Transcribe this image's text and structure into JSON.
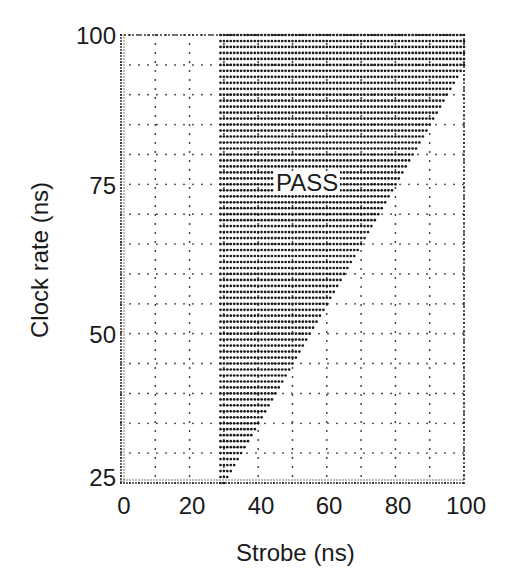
{
  "chart_data": {
    "type": "scatter",
    "title": "",
    "xlabel": "Strobe (ns)",
    "ylabel": "Clock rate (ns)",
    "xlim": [
      0,
      100
    ],
    "ylim": [
      25,
      100
    ],
    "xticks": [
      0,
      20,
      40,
      60,
      80,
      100
    ],
    "yticks": [
      25,
      50,
      75,
      100
    ],
    "x_grid_step": 10,
    "y_grid_step": 5,
    "grid": "dotted",
    "region_label": "PASS",
    "region_label_pos": {
      "strobe": 50,
      "clock": 75
    },
    "pass_region": {
      "description": "Shmoo plot pass region: strobe from ~29 ns up to min(100, clock + 5)",
      "strobe_min": 29,
      "strobe_max_rule": "clock + 5",
      "strobe_max_cap": 100,
      "boundary_points": [
        {
          "clock": 25,
          "strobe_max": 30
        },
        {
          "clock": 50,
          "strobe_max": 55
        },
        {
          "clock": 75,
          "strobe_max": 80
        },
        {
          "clock": 95,
          "strobe_max": 100
        },
        {
          "clock": 100,
          "strobe_max": 100
        }
      ],
      "strobe_step": 1,
      "clock_step": 1
    }
  },
  "labels": {
    "xlabel": "Strobe (ns)",
    "ylabel": "Clock rate (ns)",
    "pass": "PASS",
    "xticks": [
      "0",
      "20",
      "40",
      "60",
      "80",
      "100"
    ],
    "yticks": [
      "100",
      "75",
      "50",
      "25"
    ]
  }
}
